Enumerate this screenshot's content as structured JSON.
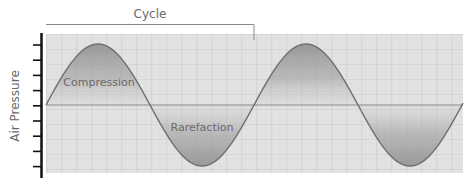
{
  "diagram": {
    "type": "sound-wave",
    "labels": {
      "cycle": "Cycle",
      "y_axis": "Air Pressure",
      "compression": "Compression",
      "rarefaction": "Rarefaction"
    },
    "wave": {
      "cycles_shown": 2,
      "period_px": 208,
      "amplitude_px": 61,
      "baseline_y": 105
    },
    "colors": {
      "background": "#e2e2e2",
      "grid_major": "#c6c6c6",
      "grid_minor": "#d6d6d6",
      "wave_stroke": "#6f6f6f",
      "fill_dark": "#8a8a8a",
      "fill_light": "#d2d2d2",
      "axis": "#111111",
      "text": "#6a6a6a"
    },
    "y_axis_ticks": 9
  }
}
